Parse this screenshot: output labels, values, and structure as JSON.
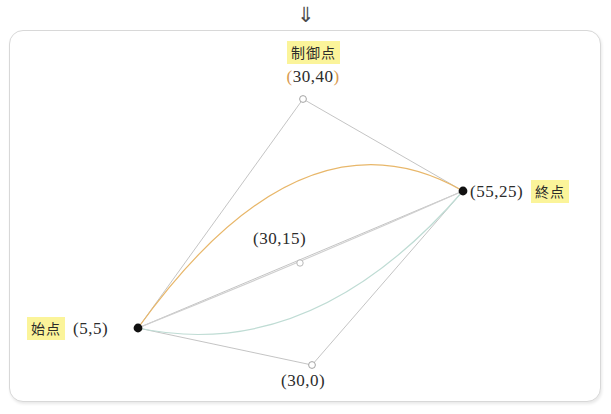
{
  "header": {
    "arrow_icon": "double-down-arrow",
    "arrow_glyph": "⇓"
  },
  "colors": {
    "highlight": "#fbf49a",
    "curve_high": "#e8b76a",
    "curve_mid": "#c9c9c9",
    "curve_low": "#b9ddd4",
    "guide_line": "#b5b5b5",
    "point_fill": "#111111",
    "card_border": "#d8d8d8",
    "text": "#2c2c2c"
  },
  "labels": {
    "control_point": "制御点",
    "start_point": "始点",
    "end_point": "終点"
  },
  "points": {
    "start": {
      "text": "(5,5)",
      "x": 5,
      "y": 5,
      "px": 138,
      "py": 328,
      "marker": "filled"
    },
    "end": {
      "text": "(55,25)",
      "x": 55,
      "y": 25,
      "px": 463,
      "py": 191,
      "marker": "filled"
    },
    "control_high": {
      "text": "(30,40)",
      "x": 30,
      "y": 40,
      "px": 303,
      "py": 99,
      "marker": "hollow"
    },
    "control_mid": {
      "text": "(30,15)",
      "x": 30,
      "y": 15,
      "px": 300,
      "py": 263,
      "marker": "hollow"
    },
    "control_low": {
      "text": "(30,0)",
      "x": 30,
      "y": 0,
      "px": 312,
      "py": 365,
      "marker": "hollow"
    }
  },
  "chart_data": {
    "type": "line",
    "title": "",
    "xlabel": "",
    "ylabel": "",
    "series": [
      {
        "name": "control (30,40)",
        "control": [
          30,
          40
        ],
        "color": "#e8b76a"
      },
      {
        "name": "control (30,15)",
        "control": [
          30,
          15
        ],
        "color": "#c9c9c9"
      },
      {
        "name": "control (30,0)",
        "control": [
          30,
          0
        ],
        "color": "#b9ddd4"
      }
    ],
    "shared": {
      "start": [
        5,
        5
      ],
      "end": [
        55,
        25
      ]
    }
  }
}
